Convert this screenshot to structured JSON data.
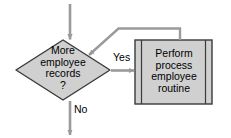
{
  "diagram": {
    "type": "flowchart",
    "title": "",
    "background_color": "#ffffff",
    "shape_fill_color": "#d0d0d0",
    "shape_border_color": "#333333",
    "connector_color": "#999999",
    "text_color": "#000000",
    "nodes": {
      "decision": {
        "shape": "diamond",
        "name": "decision-more-employee-records",
        "line1": "More",
        "line2": "employee",
        "line3": "records",
        "line4": "?"
      },
      "process": {
        "shape": "predefined-process",
        "name": "perform-process-employee-routine",
        "line1": "Perform",
        "line2": "process",
        "line3": "employee",
        "line4": "routine"
      }
    },
    "edges": {
      "entry": {
        "label": "",
        "from": "top",
        "to": "decision"
      },
      "yes": {
        "label": "Yes",
        "from": "decision",
        "to": "process"
      },
      "no": {
        "label": "No",
        "from": "decision",
        "to": "exit"
      },
      "loopback": {
        "label": "",
        "from": "process",
        "to": "decision"
      }
    }
  }
}
